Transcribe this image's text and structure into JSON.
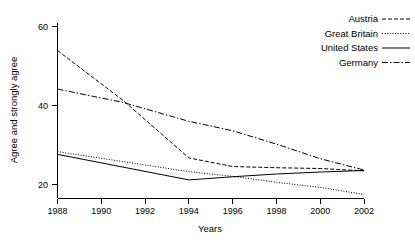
{
  "chart_data": {
    "type": "line",
    "title": "",
    "xlabel": "Years",
    "ylabel": "Agree and strongly agree",
    "x": [
      1988,
      1990,
      1992,
      1994,
      1996,
      1998,
      2000,
      2002
    ],
    "xticks": [
      "1988",
      "1990",
      "1992",
      "1994",
      "1996",
      "1998",
      "2000",
      "2002"
    ],
    "yticks": [
      "20",
      "40",
      "60"
    ],
    "ytick_values": [
      20,
      40,
      60
    ],
    "xlim": [
      1988,
      2002
    ],
    "ylim": [
      16.5,
      61
    ],
    "grid": false,
    "legend_position": "top-right",
    "series": [
      {
        "name": "Austria",
        "dash": "dashed",
        "dasharray": "4,2",
        "x": [
          1988,
          1991,
          1994,
          1996,
          1998,
          2000,
          2002
        ],
        "values": [
          54.0,
          41.3,
          26.7,
          24.5,
          24.2,
          24.0,
          23.4
        ]
      },
      {
        "name": "Great Britain",
        "dash": "dotted",
        "dasharray": "1,1.6",
        "x": [
          1988,
          1994,
          1996,
          1998,
          2000,
          2002
        ],
        "values": [
          28.3,
          23.2,
          22.0,
          20.5,
          19.2,
          17.4
        ]
      },
      {
        "name": "United States",
        "dash": "solid",
        "dasharray": "none",
        "x": [
          1988,
          1994,
          1996,
          1998,
          2000,
          2002
        ],
        "values": [
          27.6,
          21.1,
          21.9,
          22.6,
          23.1,
          23.5
        ]
      },
      {
        "name": "Germany",
        "dash": "dashdot",
        "dasharray": "6,2,1.5,2",
        "x": [
          1988,
          1991,
          1994,
          1996,
          1998,
          2000,
          2002
        ],
        "values": [
          44.2,
          40.8,
          36.0,
          33.6,
          30.2,
          26.5,
          23.6
        ]
      }
    ]
  },
  "legend": {
    "items": [
      {
        "label": "Austria"
      },
      {
        "label": "Great Britain"
      },
      {
        "label": "United States"
      },
      {
        "label": "Germany"
      }
    ]
  },
  "axes": {
    "x_title": "Years",
    "y_title": "Agree and strongly agree"
  },
  "colors": {
    "ink": "#000000",
    "background": "#ffffff"
  }
}
